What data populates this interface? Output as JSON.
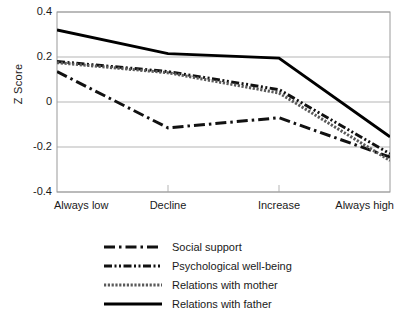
{
  "chart_data": {
    "type": "line",
    "title": "",
    "xlabel": "",
    "ylabel": "Z Score",
    "categories": [
      "Always low",
      "Decline",
      "Increase",
      "Always high"
    ],
    "ylim": [
      -0.4,
      0.4
    ],
    "yticks": [
      "0.4",
      "0.2",
      "0",
      "-0.2",
      "-0.4"
    ],
    "ytick_values": [
      0.4,
      0.2,
      0,
      -0.2,
      -0.4
    ],
    "grid": true,
    "legend_position": "bottom-center",
    "series": [
      {
        "name": "Social support",
        "values": [
          0.135,
          -0.115,
          -0.07,
          -0.245
        ],
        "style": "dash-dot",
        "color": "#111111",
        "width": 3
      },
      {
        "name": "Psychological well-being",
        "values": [
          0.18,
          0.135,
          0.055,
          -0.23
        ],
        "style": "dash-dot-dot",
        "color": "#111111",
        "width": 3
      },
      {
        "name": "Relations with mother",
        "values": [
          0.175,
          0.13,
          0.04,
          -0.26
        ],
        "style": "fine-dotted",
        "color": "#5a5a5a",
        "width": 3
      },
      {
        "name": "Relations with father",
        "values": [
          0.32,
          0.215,
          0.195,
          -0.155
        ],
        "style": "solid",
        "color": "#000000",
        "width": 3
      }
    ]
  },
  "axes": {
    "frame_color": "#9a9a9a",
    "grid_color": "#b5b5b5"
  }
}
